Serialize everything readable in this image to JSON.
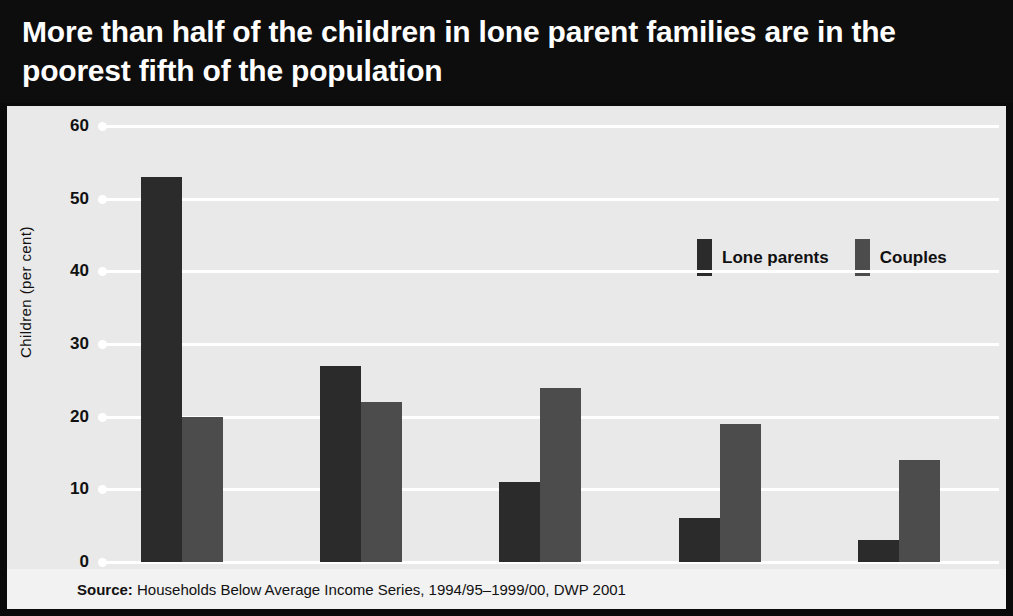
{
  "title": "More than half of the children in lone parent families are in the poorest fifth of the population",
  "source_prefix": "Source:",
  "source_text": " Households Below Average Income Series, 1994/95–1999/00, DWP 2001",
  "colors": {
    "title_background": "#0d0d0d",
    "title_text": "#ffffff",
    "panel_background": "#e9e9e9",
    "gridline": "#ffffff",
    "lone_parents": "#2b2b2b",
    "couples": "#4c4c4c",
    "source_background": "#f2f2f2",
    "axis_text": "#111111"
  },
  "chart_data": {
    "type": "bar",
    "title": "More than half of the children in lone parent families are in the poorest fifth of the population",
    "subtitle": "",
    "xlabel": "",
    "ylabel": "Children (per cent)",
    "categories": [
      "Poorest fifth",
      "2nd",
      "3rd",
      "4th",
      "Richest fifth"
    ],
    "series": [
      {
        "name": "Lone parents",
        "color": "#2b2b2b",
        "values": [
          53,
          27,
          11,
          6,
          3
        ]
      },
      {
        "name": "Couples",
        "color": "#4c4c4c",
        "values": [
          20,
          22,
          24,
          19,
          14
        ]
      }
    ],
    "ylim": [
      0,
      60
    ],
    "yticks": [
      0,
      10,
      20,
      30,
      40,
      50,
      60
    ],
    "ytick_labels": [
      "0",
      "10",
      "20",
      "30",
      "40",
      "50",
      "60"
    ],
    "grid": true,
    "grid_axis": "y",
    "legend": [
      "Lone parents",
      "Couples"
    ],
    "legend_position": "top-right",
    "bar_group_style": "adjacent-pairs",
    "source": "Source: Households Below Average Income Series, 1994/95–1999/00, DWP 2001"
  }
}
